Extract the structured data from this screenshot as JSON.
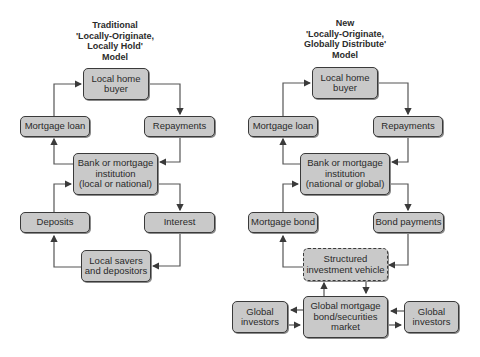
{
  "left_model": {
    "title": [
      "Traditional",
      "'Locally-Originate,",
      "Locally Hold'",
      "Model"
    ],
    "boxes": {
      "home_buyer": "Local home buyer",
      "mortgage_loan": "Mortgage loan",
      "repayments": "Repayments",
      "bank": [
        "Bank or mortgage",
        "institution",
        "(local or national)"
      ],
      "deposits": "Deposits",
      "interest": "Interest",
      "savers": [
        "Local savers",
        "and depositors"
      ]
    }
  },
  "right_model": {
    "title": [
      "New",
      "'Locally-Originate,",
      "Globally Distribute'",
      "Model"
    ],
    "boxes": {
      "home_buyer": "Local home buyer",
      "mortgage_loan": "Mortgage loan",
      "repayments": "Repayments",
      "bank": [
        "Bank or mortgage",
        "institution",
        "(national or global)"
      ],
      "mortgage_bond": "Mortgage bond",
      "bond_payments": "Bond payments",
      "siv": [
        "Structured",
        "investment vehicle"
      ],
      "global_market": [
        "Global mortgage",
        "bond/securities",
        "market"
      ],
      "investors_left": [
        "Global",
        "investors"
      ],
      "investors_right": [
        "Global",
        "investors"
      ]
    }
  },
  "colors": {
    "box_fill": "#c9c9c9",
    "box_border": "#3a3a3a",
    "arrow": "#3a3a3a"
  }
}
